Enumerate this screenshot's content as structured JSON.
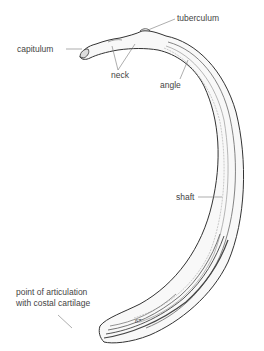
{
  "diagram": {
    "labels": {
      "tuberculum": "tuberculum",
      "capitulum": "capitulum",
      "neck": "neck",
      "angle": "angle",
      "shaft": "shaft",
      "articulation_line1": "point of articulation",
      "articulation_line2": "with costal cartilage"
    },
    "plate_number": "67",
    "colors": {
      "ink": "#333333",
      "label_text": "#444444",
      "leader_line": "#777777",
      "background": "#ffffff"
    }
  }
}
